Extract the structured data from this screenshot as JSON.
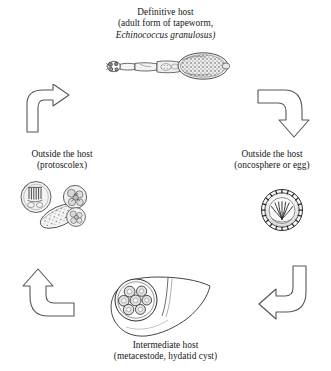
{
  "diagram": {
    "type": "life-cycle",
    "background_color": "#ffffff",
    "ink_color": "#1a1a1a",
    "stages": [
      {
        "id": "definitive-host",
        "position": "top",
        "label_line1": "Definitive host",
        "label_line2": "(adult form of tapeworm,",
        "label_line3_italic": "Echinococcus granulosus)",
        "figure": "adult-tapeworm-illustration"
      },
      {
        "id": "outside-host-oncosphere",
        "position": "right",
        "label_line1": "Outside the host",
        "label_line2": "(oncosphere or egg)",
        "figure": "egg-oncosphere-illustration"
      },
      {
        "id": "intermediate-host",
        "position": "bottom",
        "label_line1": "Intermediate host",
        "label_line2": "(metacestode, hydatid cyst)",
        "figure": "liver-hydatid-cyst-illustration"
      },
      {
        "id": "outside-host-protoscolex",
        "position": "left",
        "label_line1": "Outside the host",
        "label_line2": "(protoscolex)",
        "figure": "protoscolex-illustration"
      }
    ],
    "arrows": [
      {
        "id": "arrow-top-left",
        "from": "outside-host-protoscolex",
        "to": "definitive-host",
        "direction": "up-then-right"
      },
      {
        "id": "arrow-top-right",
        "from": "definitive-host",
        "to": "outside-host-oncosphere",
        "direction": "right-then-down"
      },
      {
        "id": "arrow-bottom-right",
        "from": "outside-host-oncosphere",
        "to": "intermediate-host",
        "direction": "down-then-left"
      },
      {
        "id": "arrow-bottom-left",
        "from": "intermediate-host",
        "to": "outside-host-protoscolex",
        "direction": "left-then-up"
      }
    ]
  }
}
